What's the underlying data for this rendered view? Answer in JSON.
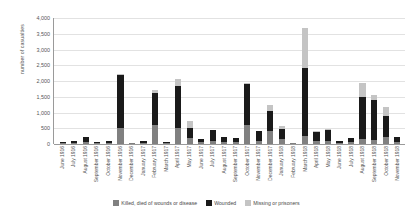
{
  "chart_data": {
    "type": "bar",
    "stacked": true,
    "title": "",
    "xlabel": "",
    "ylabel": "number of casualties",
    "ylim": [
      0,
      4000
    ],
    "ytick_step": 500,
    "ytick_labels": [
      "4,000",
      "3,500",
      "3,000",
      "2,500",
      "2,000",
      "1,500",
      "1,000",
      "500",
      "0"
    ],
    "grid": true,
    "legend_position": "bottom",
    "colors": {
      "killed": "#808080",
      "wounded": "#1a1a1a",
      "missing": "#c4c4c4",
      "gridline": "#e2e2e2",
      "axis": "#9a9a9a"
    },
    "categories": [
      "June 1916",
      "July 1916",
      "August 1916",
      "September 1916",
      "October 1916",
      "November 1916",
      "December 1916",
      "January 1917",
      "February 1917",
      "March 1917",
      "April 1917",
      "May 1917",
      "June 1917",
      "July 1917",
      "August 1917",
      "September 1917",
      "October 1917",
      "November 1917",
      "December 1917",
      "January 1918",
      "February 1918",
      "March 1918",
      "April 1918",
      "May 1918",
      "June 1918",
      "July 1918",
      "August 1918",
      "September 1918",
      "October 1918",
      "November 1918"
    ],
    "series": [
      {
        "name": "Killed, died of wounds or disease",
        "key": "killed",
        "values": [
          25,
          30,
          60,
          15,
          30,
          500,
          5,
          30,
          600,
          10,
          500,
          180,
          50,
          110,
          60,
          50,
          610,
          110,
          400,
          150,
          10,
          250,
          80,
          100,
          25,
          50,
          170,
          120,
          230,
          60
        ]
      },
      {
        "name": "Wounded",
        "key": "wounded",
        "values": [
          55,
          60,
          155,
          35,
          80,
          1690,
          15,
          70,
          1010,
          30,
          1350,
          340,
          120,
          320,
          160,
          140,
          1280,
          310,
          640,
          330,
          20,
          2150,
          300,
          350,
          65,
          140,
          1310,
          1290,
          660,
          170
        ]
      },
      {
        "name": "Missing or prisoners",
        "key": "missing",
        "values": [
          0,
          0,
          0,
          0,
          0,
          10,
          0,
          0,
          120,
          0,
          230,
          210,
          0,
          0,
          0,
          0,
          60,
          0,
          210,
          80,
          0,
          1290,
          10,
          10,
          0,
          0,
          470,
          140,
          300,
          0
        ]
      }
    ]
  },
  "legend": {
    "items": [
      {
        "label": "Killed, died of wounds or disease",
        "key": "killed"
      },
      {
        "label": "Wounded",
        "key": "wounded"
      },
      {
        "label": "Missing or prisoners",
        "key": "missing"
      }
    ]
  }
}
